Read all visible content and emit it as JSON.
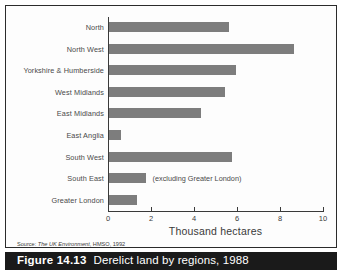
{
  "figure": {
    "caption_number": "Figure 14.13",
    "caption_text": "Derelict land by regions, 1988",
    "source_prefix": "Source: ",
    "source_italic": "The UK Environment",
    "source_suffix": ", HMSO, 1992",
    "bar_color": "#7d7d7d",
    "caption_bar_color": "#1a1a1a",
    "frame_color": "#2b2b2b",
    "background_color": "#fdfdfd"
  },
  "annotation": {
    "south_east_note": "(excluding Greater London)"
  },
  "chart_data": {
    "type": "bar",
    "orientation": "horizontal",
    "title": "Derelict land by regions, 1988",
    "xlabel": "Thousand hectares",
    "ylabel": "",
    "xlim": [
      0,
      10
    ],
    "xticks": [
      0,
      2,
      4,
      6,
      8,
      10
    ],
    "xtick_labels": [
      "0",
      "2",
      "4",
      "6",
      "8",
      "10"
    ],
    "grid": false,
    "legend": false,
    "categories": [
      "North",
      "North West",
      "Yorkshire & Humberside",
      "West Midlands",
      "East Midlands",
      "East Anglia",
      "South West",
      "South East",
      "Greater London"
    ],
    "values": [
      5.6,
      8.6,
      5.9,
      5.4,
      4.3,
      0.55,
      5.7,
      1.7,
      1.3
    ],
    "units": "thousand hectares",
    "annotations": [
      {
        "category": "South East",
        "text": "(excluding Greater London)"
      }
    ]
  }
}
